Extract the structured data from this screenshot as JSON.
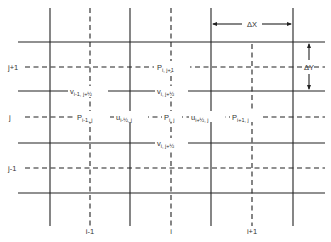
{
  "grid": {
    "solid_vertical_x": [
      50,
      130,
      211,
      293
    ],
    "dashed_vertical_x": [
      90,
      171,
      252
    ],
    "solid_horizontal_y": [
      42,
      91,
      143,
      193
    ],
    "dashed_horizontal_y": [
      67,
      117,
      168
    ],
    "vertical_extent": [
      8,
      226
    ],
    "horizontal_extent": [
      18,
      325
    ],
    "line_color": "#222222"
  },
  "axis_labels": {
    "rows": [
      {
        "label": "j+1",
        "y": 67
      },
      {
        "label": "j",
        "y": 117
      },
      {
        "label": "j-1",
        "y": 168
      }
    ],
    "cols": [
      {
        "label": "i-1",
        "x": 90
      },
      {
        "label": "i",
        "x": 171
      },
      {
        "label": "i+1",
        "x": 252
      }
    ]
  },
  "dimensions": {
    "dx_label": "ΔX",
    "dy_label": "ΔY"
  },
  "nodes": {
    "p_top": {
      "base": "P",
      "sub": "i, j+1"
    },
    "v_left": {
      "base": "v",
      "sub": "i-1, j+½"
    },
    "v_mid_top": {
      "base": "v",
      "sub": "i, j+½"
    },
    "p_left": {
      "base": "P",
      "sub": "i-1, j"
    },
    "u_left": {
      "base": "u",
      "sub": "i-½, j"
    },
    "p_center": {
      "base": "P",
      "sub": "i, j"
    },
    "u_right": {
      "base": "u",
      "sub": "i+½, j"
    },
    "p_right": {
      "base": "P",
      "sub": "i+1, j"
    },
    "v_mid_bottom": {
      "base": "v",
      "sub": "i, j+½"
    }
  }
}
